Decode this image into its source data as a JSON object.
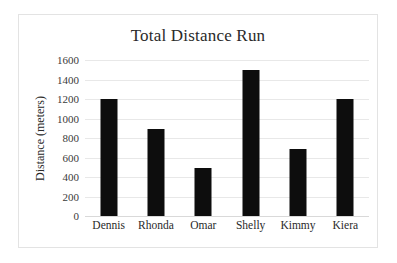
{
  "chart_data": {
    "type": "bar",
    "title": "Total Distance Run",
    "xlabel": "",
    "ylabel": "Distance (meters)",
    "categories": [
      "Dennis",
      "Rhonda",
      "Omar",
      "Shelly",
      "Kimmy",
      "Kiera"
    ],
    "values": [
      1200,
      890,
      490,
      1500,
      690,
      1200
    ],
    "series": [
      {
        "name": "Total Distance Run",
        "values": [
          1200,
          890,
          490,
          1500,
          690,
          1200
        ]
      }
    ],
    "ylim": [
      0,
      1600
    ],
    "ytick_labels": [
      "0",
      "200",
      "400",
      "600",
      "800",
      "1000",
      "1200",
      "1400",
      "1600"
    ],
    "ytick_values": [
      0,
      200,
      400,
      600,
      800,
      1000,
      1200,
      1400,
      1600
    ],
    "grid": true,
    "legend": false,
    "legend_position": "none",
    "bar_color": "#0d0d0d",
    "gridline_color": "#e8e8e8",
    "background_color": "#ffffff",
    "border_color": "#e3e3e3",
    "text_color": "#2a2a2a"
  }
}
